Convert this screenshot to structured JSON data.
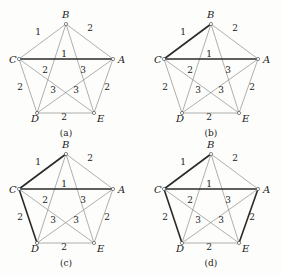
{
  "graph": {
    "vertices": [
      {
        "id": "A",
        "x": 113,
        "y": 59,
        "lx": 118,
        "ly": 63
      },
      {
        "id": "B",
        "x": 66,
        "y": 24,
        "lx": 62,
        "ly": 18
      },
      {
        "id": "C",
        "x": 19,
        "y": 59,
        "lx": 9,
        "ly": 63
      },
      {
        "id": "D",
        "x": 37,
        "y": 113,
        "lx": 31,
        "ly": 122
      },
      {
        "id": "E",
        "x": 94,
        "y": 113,
        "lx": 97,
        "ly": 122
      }
    ],
    "edges": [
      {
        "id": "AB",
        "from": "A",
        "to": "B",
        "weight": "2",
        "wx": 90,
        "wy": 31
      },
      {
        "id": "BC",
        "from": "B",
        "to": "C",
        "weight": "1",
        "wx": 38,
        "wy": 35
      },
      {
        "id": "AC",
        "from": "A",
        "to": "C",
        "weight": "1",
        "wx": 64,
        "wy": 57
      },
      {
        "id": "BD",
        "from": "B",
        "to": "D",
        "weight": "2",
        "wx": 45,
        "wy": 73
      },
      {
        "id": "BE",
        "from": "B",
        "to": "E",
        "weight": "3",
        "wx": 83,
        "wy": 73
      },
      {
        "id": "CD",
        "from": "C",
        "to": "D",
        "weight": "2",
        "wx": 20,
        "wy": 90
      },
      {
        "id": "AE",
        "from": "A",
        "to": "E",
        "weight": "2",
        "wx": 107,
        "wy": 90
      },
      {
        "id": "DE",
        "from": "D",
        "to": "E",
        "weight": "2",
        "wx": 64,
        "wy": 120
      },
      {
        "id": "CE",
        "from": "C",
        "to": "E",
        "weight": "3",
        "wx": 53,
        "wy": 93
      },
      {
        "id": "AD",
        "from": "A",
        "to": "D",
        "weight": "3",
        "wx": 76,
        "wy": 93
      }
    ]
  },
  "panels": [
    {
      "id": "a",
      "label": "(a)",
      "dx": 0,
      "dy": 0,
      "bold_edges": [
        "AC"
      ]
    },
    {
      "id": "b",
      "label": "(b)",
      "dx": 145,
      "dy": 0,
      "bold_edges": [
        "AC",
        "BC"
      ]
    },
    {
      "id": "c",
      "label": "(c)",
      "dx": 0,
      "dy": 130,
      "bold_edges": [
        "AC",
        "BC",
        "CD"
      ]
    },
    {
      "id": "d",
      "label": "(d)",
      "dx": 145,
      "dy": 130,
      "bold_edges": [
        "AC",
        "BC",
        "CD",
        "AE"
      ]
    }
  ],
  "panel_label_pos": {
    "x": 66,
    "y": 136
  },
  "colors": {
    "edge": "#9a9a9a",
    "bold_edge": "#2a2a2a",
    "text": "#222222",
    "background": "#fdfdfb"
  }
}
